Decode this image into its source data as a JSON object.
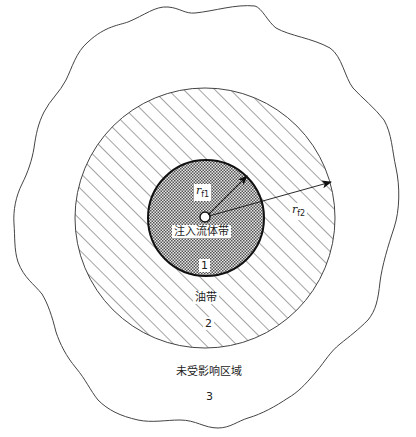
{
  "diagram": {
    "type": "concentric-zone-diagram",
    "colors": {
      "line": "#333333",
      "hatch": "#555555",
      "dots": "#666666",
      "background": "#ffffff"
    },
    "zones": [
      {
        "id": 1,
        "name": "注入流体带",
        "number": "1",
        "fill": "stipple"
      },
      {
        "id": 2,
        "name": "油带",
        "number": "2",
        "fill": "diagonal-hatch"
      },
      {
        "id": 3,
        "name": "未受影响区域",
        "number": "3",
        "fill": "none"
      }
    ],
    "radii": [
      {
        "symbol": "r",
        "subscript": "f1",
        "label": "r_f1"
      },
      {
        "symbol": "r",
        "subscript": "f2",
        "label": "r_f2"
      }
    ],
    "labels": {
      "zone1_name": "注入流体带",
      "zone1_number": "1",
      "zone2_name": "油带",
      "zone2_number": "2",
      "zone3_name": "未受影响区域",
      "zone3_number": "3",
      "rf1_symbol": "r",
      "rf1_sub": "f1",
      "rf2_symbol": "r",
      "rf2_sub": "f2"
    }
  }
}
